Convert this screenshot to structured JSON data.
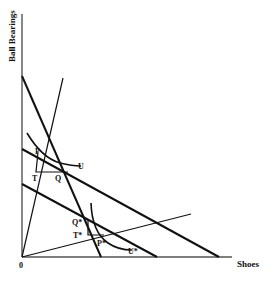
{
  "diagram": {
    "y_axis_label": "Ball Bearings",
    "x_axis_label": "Shoes",
    "origin_label": "0",
    "points": {
      "P": "P",
      "Q": "Q",
      "T": "T",
      "U": "U",
      "P_star": "P*",
      "Q_star": "Q*",
      "T_star": "T*",
      "U_star": "U*"
    },
    "colors": {
      "ink": "#111111",
      "axis": "#555555",
      "background": "#ffffff"
    }
  }
}
